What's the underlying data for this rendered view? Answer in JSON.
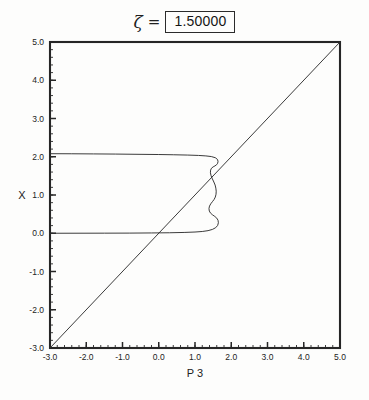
{
  "title": {
    "symbol": "ζ",
    "equals": "=",
    "value": "1.50000"
  },
  "chart_data": {
    "type": "line",
    "title": "ζ = 1.50000",
    "xlabel": "P 3",
    "ylabel": "X",
    "xlim": [
      -3.0,
      5.0
    ],
    "ylim": [
      -3.0,
      5.0
    ],
    "grid": false,
    "legend": null,
    "xticks": [
      "-3.0",
      "-2.0",
      "-1.0",
      "0.0",
      "1.0",
      "2.0",
      "3.0",
      "4.0",
      "5.0"
    ],
    "yticks": [
      "-3.0",
      "-2.0",
      "-1.0",
      "0.0",
      "1.0",
      "2.0",
      "3.0",
      "4.0",
      "5.0"
    ],
    "xtick_values": [
      -3,
      -2,
      -1,
      0,
      1,
      2,
      3,
      4,
      5
    ],
    "ytick_values": [
      -3,
      -2,
      -1,
      0,
      1,
      2,
      3,
      4,
      5
    ],
    "minor_tick_step": 0.2,
    "series": [
      {
        "name": "diagonal",
        "style": "solid",
        "color": "#303030",
        "points": [
          [
            -3.0,
            -3.0
          ],
          [
            5.0,
            5.0
          ]
        ]
      },
      {
        "name": "response-curve",
        "style": "solid",
        "color": "#303030",
        "points": [
          [
            -3.0,
            2.08
          ],
          [
            -2.4,
            2.078
          ],
          [
            -1.8,
            2.074
          ],
          [
            -1.2,
            2.07
          ],
          [
            -0.6,
            2.064
          ],
          [
            0.0,
            2.058
          ],
          [
            0.4,
            2.052
          ],
          [
            0.8,
            2.044
          ],
          [
            1.1,
            2.034
          ],
          [
            1.3,
            2.022
          ],
          [
            1.45,
            2.005
          ],
          [
            1.56,
            1.975
          ],
          [
            1.62,
            1.93
          ],
          [
            1.635,
            1.88
          ],
          [
            1.625,
            1.83
          ],
          [
            1.595,
            1.79
          ],
          [
            1.55,
            1.76
          ],
          [
            1.5,
            1.735
          ],
          [
            1.455,
            1.7
          ],
          [
            1.43,
            1.65
          ],
          [
            1.425,
            1.58
          ],
          [
            1.445,
            1.5
          ],
          [
            1.48,
            1.42
          ],
          [
            1.52,
            1.34
          ],
          [
            1.555,
            1.26
          ],
          [
            1.575,
            1.18
          ],
          [
            1.585,
            1.1
          ],
          [
            1.58,
            1.02
          ],
          [
            1.56,
            0.945
          ],
          [
            1.525,
            0.88
          ],
          [
            1.48,
            0.825
          ],
          [
            1.435,
            0.77
          ],
          [
            1.4,
            0.71
          ],
          [
            1.385,
            0.645
          ],
          [
            1.395,
            0.58
          ],
          [
            1.43,
            0.525
          ],
          [
            1.485,
            0.48
          ],
          [
            1.545,
            0.44
          ],
          [
            1.6,
            0.395
          ],
          [
            1.635,
            0.34
          ],
          [
            1.645,
            0.275
          ],
          [
            1.625,
            0.205
          ],
          [
            1.57,
            0.145
          ],
          [
            1.48,
            0.1
          ],
          [
            1.36,
            0.068
          ],
          [
            1.2,
            0.046
          ],
          [
            1.0,
            0.032
          ],
          [
            0.7,
            0.021
          ],
          [
            0.3,
            0.013
          ],
          [
            -0.2,
            0.008
          ],
          [
            -0.8,
            0.004
          ],
          [
            -1.5,
            0.002
          ],
          [
            -2.2,
            0.001
          ],
          [
            -3.0,
            0.0
          ]
        ]
      }
    ]
  }
}
